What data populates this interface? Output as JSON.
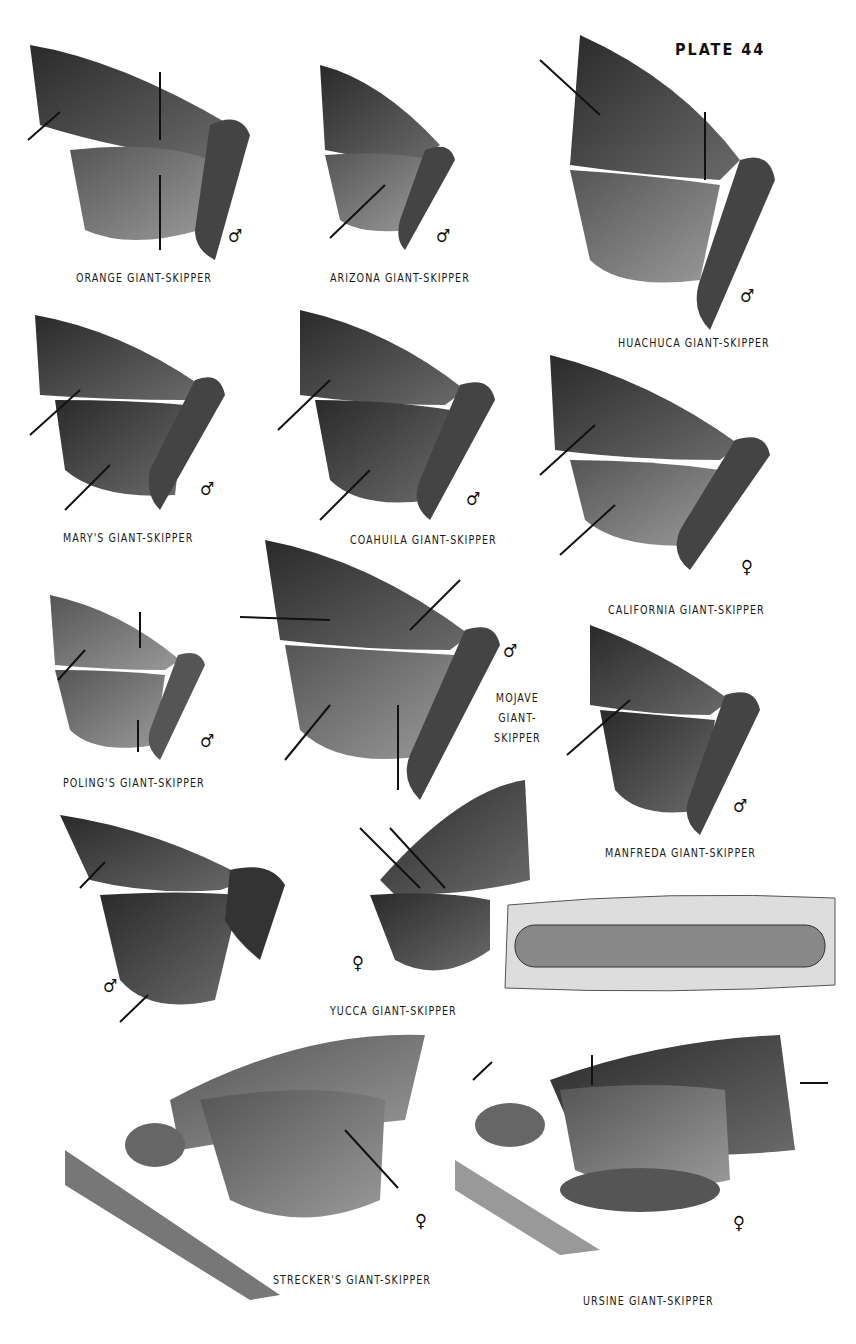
{
  "plate": {
    "title": "PLATE 44"
  },
  "species": [
    {
      "name": "ORANGE GIANT-SKIPPER",
      "sex": "♂"
    },
    {
      "name": "ARIZONA GIANT-SKIPPER",
      "sex": "♂"
    },
    {
      "name": "HUACHUCA GIANT-SKIPPER",
      "sex": "♂"
    },
    {
      "name": "MARY'S GIANT-SKIPPER",
      "sex": "♂"
    },
    {
      "name": "COAHUILA GIANT-SKIPPER",
      "sex": "♂"
    },
    {
      "name": "CALIFORNIA GIANT-SKIPPER",
      "sex": "♀"
    },
    {
      "name": "POLING'S GIANT-SKIPPER",
      "sex": "♂"
    },
    {
      "name": "MOJAVE",
      "name_line2": "GIANT-",
      "name_line3": "SKIPPER",
      "sex": "♂"
    },
    {
      "name": "MANFREDA GIANT-SKIPPER",
      "sex": "♂"
    },
    {
      "name": "YUCCA GIANT-SKIPPER",
      "sex": "♂",
      "sex2": "♀"
    },
    {
      "name": "STRECKER'S GIANT-SKIPPER",
      "sex": "♀"
    },
    {
      "name": "URSINE GIANT-SKIPPER",
      "sex": "♀"
    }
  ]
}
